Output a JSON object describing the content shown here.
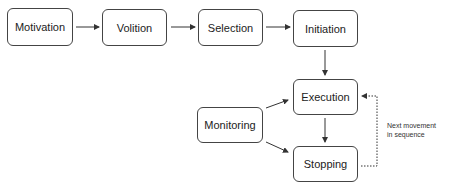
{
  "diagram": {
    "nodes": [
      {
        "id": "motivation",
        "label": "Motivation"
      },
      {
        "id": "volition",
        "label": "Volition"
      },
      {
        "id": "selection",
        "label": "Selection"
      },
      {
        "id": "initiation",
        "label": "Initiation"
      },
      {
        "id": "execution",
        "label": "Execution"
      },
      {
        "id": "monitoring",
        "label": "Monitoring"
      },
      {
        "id": "stopping",
        "label": "Stopping"
      }
    ],
    "edges": [
      {
        "from": "motivation",
        "to": "volition",
        "style": "solid"
      },
      {
        "from": "volition",
        "to": "selection",
        "style": "solid"
      },
      {
        "from": "selection",
        "to": "initiation",
        "style": "solid"
      },
      {
        "from": "initiation",
        "to": "execution",
        "style": "solid"
      },
      {
        "from": "execution",
        "to": "stopping",
        "style": "solid"
      },
      {
        "from": "monitoring",
        "to": "execution",
        "style": "solid"
      },
      {
        "from": "monitoring",
        "to": "stopping",
        "style": "solid"
      },
      {
        "from": "stopping",
        "to": "execution",
        "style": "dotted",
        "label": "Next movement in sequence"
      }
    ],
    "note": {
      "line1": "Next movement",
      "line2": "in sequence"
    }
  }
}
